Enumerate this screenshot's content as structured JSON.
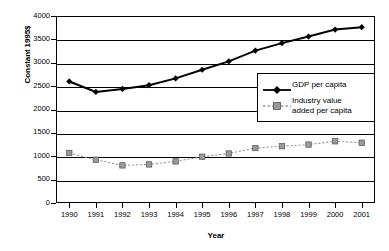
{
  "chart_data": {
    "type": "line",
    "title": "",
    "xlabel": "Year",
    "ylabel": "Constant 1995$",
    "categories": [
      "1990",
      "1991",
      "1992",
      "1993",
      "1994",
      "1995",
      "1996",
      "1997",
      "1998",
      "1999",
      "2000",
      "2001"
    ],
    "x": [
      1990,
      1991,
      1992,
      1993,
      1994,
      1995,
      1996,
      1997,
      1998,
      1999,
      2000,
      2001
    ],
    "xlim": [
      1990,
      2001
    ],
    "ylim": [
      0,
      4000
    ],
    "yticks": [
      0,
      500,
      1000,
      1500,
      2000,
      2500,
      3000,
      3500,
      4000
    ],
    "ytick_labels": [
      "0",
      "500",
      "1000",
      "1500",
      "2000",
      "2500",
      "3000",
      "3500",
      "4000"
    ],
    "grid": true,
    "grid_axis": "y",
    "legend_position": "center-right",
    "series": [
      {
        "name": "GDP per capita",
        "marker": "diamond",
        "color": "#000000",
        "linestyle": "solid",
        "values": [
          2600,
          2375,
          2440,
          2520,
          2665,
          2850,
          3030,
          3260,
          3420,
          3560,
          3710,
          3760
        ]
      },
      {
        "name": "Industry value added per capita",
        "legend_label_line1": "Industry value",
        "legend_label_line2": "added per capita",
        "marker": "square",
        "color": "#999999",
        "linestyle": "dotted",
        "values": [
          1070,
          925,
          805,
          825,
          890,
          990,
          1060,
          1175,
          1215,
          1250,
          1320,
          1290
        ]
      }
    ]
  },
  "legend": {
    "items": [
      {
        "label": "GDP per capita"
      },
      {
        "label_line1": "Industry value",
        "label_line2": "added per capita"
      }
    ]
  },
  "axes": {
    "y_title": "Constant 1995$",
    "x_title": "Year"
  }
}
